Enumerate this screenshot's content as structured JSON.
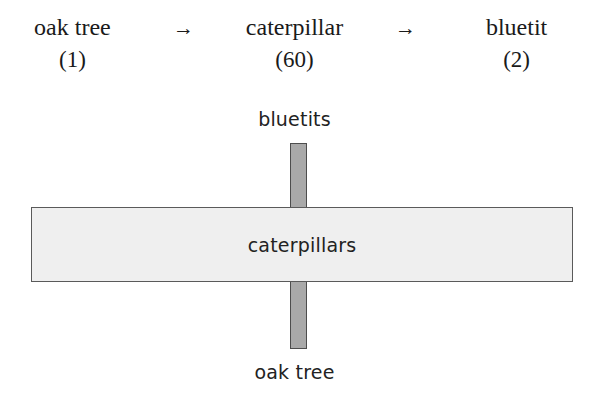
{
  "food_chain": {
    "nodes": [
      {
        "name": "oak tree",
        "count": "(1)"
      },
      {
        "name": "caterpillar",
        "count": "(60)"
      },
      {
        "name": "bluetit",
        "count": "(2)"
      }
    ],
    "arrows": [
      {
        "glyph": "→"
      },
      {
        "glyph": "→"
      }
    ]
  },
  "biomass_diagram": {
    "top_label": "bluetits",
    "middle_label": "caterpillars",
    "bottom_label": "oak tree",
    "colors": {
      "vertical_bar_fill": "#a9a9a9",
      "vertical_bar_border": "#4d4d4d",
      "horizontal_bar_fill": "#efefef",
      "horizontal_bar_border": "#5a5a5a",
      "text": "#222222",
      "background": "#ffffff"
    }
  }
}
